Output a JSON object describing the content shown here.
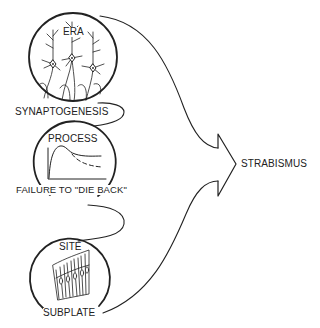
{
  "diagram": {
    "stages": [
      {
        "heading": "ERA",
        "label": "SYNAPTOGENESIS",
        "illustration": "cortical-neurons"
      },
      {
        "heading": "PROCESS",
        "label": "FAILURE TO \"DIE BACK\"",
        "illustration": "growth-curve-graph"
      },
      {
        "heading": "SITE",
        "label": "SUBPLATE",
        "illustration": "subplate-cortex-slab"
      }
    ],
    "outcome": "STRABISMUS",
    "colors": {
      "stroke": "#222222",
      "background": "#ffffff"
    }
  }
}
